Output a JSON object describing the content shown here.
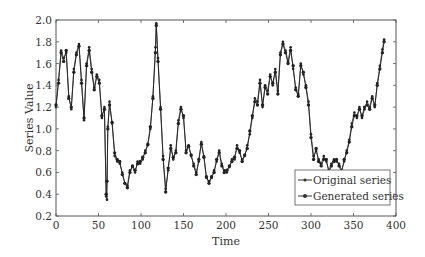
{
  "chart_data": {
    "type": "line",
    "title": "",
    "xlabel": "Time",
    "ylabel": "Series Value",
    "xlim": [
      0,
      400
    ],
    "ylim": [
      0.2,
      2.0
    ],
    "xticks": [
      0,
      50,
      100,
      150,
      200,
      250,
      300,
      350,
      400
    ],
    "yticks": [
      0.2,
      0.4,
      0.6,
      0.8,
      1.0,
      1.2,
      1.4,
      1.6,
      1.8,
      2.0
    ],
    "ytick_labels": [
      "0.2",
      "0.4",
      "0.6",
      "0.8",
      "1.0",
      "1.2",
      "1.4",
      "1.6",
      "1.8",
      "2.0"
    ],
    "grid": false,
    "legend_position": "lower right",
    "series": [
      {
        "name": "Original series",
        "marker": "dot",
        "x": [
          0,
          3,
          6,
          9,
          12,
          15,
          18,
          21,
          24,
          27,
          30,
          33,
          36,
          39,
          42,
          45,
          48,
          51,
          54,
          57,
          59,
          60,
          61,
          63,
          66,
          69,
          72,
          75,
          78,
          81,
          84,
          87,
          90,
          93,
          96,
          99,
          102,
          105,
          108,
          111,
          114,
          117,
          118,
          120,
          123,
          126,
          129,
          132,
          135,
          138,
          141,
          144,
          147,
          150,
          153,
          156,
          159,
          162,
          165,
          168,
          171,
          174,
          177,
          180,
          183,
          186,
          189,
          192,
          195,
          198,
          201,
          204,
          207,
          210,
          213,
          216,
          219,
          222,
          225,
          228,
          231,
          234,
          237,
          240,
          243,
          246,
          249,
          252,
          255,
          258,
          261,
          264,
          267,
          270,
          273,
          276,
          279,
          282,
          285,
          288,
          291,
          294,
          297,
          300,
          303,
          306,
          309,
          312,
          315,
          318,
          321,
          324,
          327,
          330,
          333,
          336,
          339,
          342,
          345,
          348,
          351,
          354,
          357,
          360,
          363,
          366,
          369,
          372,
          375,
          378,
          381,
          384,
          386
        ],
        "values": [
          1.2,
          1.45,
          1.72,
          1.65,
          1.7,
          1.3,
          1.18,
          1.55,
          1.7,
          1.78,
          1.45,
          1.08,
          1.6,
          1.75,
          1.55,
          1.38,
          1.5,
          1.45,
          1.1,
          1.2,
          0.38,
          0.35,
          1.02,
          1.25,
          1.05,
          0.75,
          0.7,
          0.68,
          0.6,
          0.5,
          0.48,
          0.62,
          0.65,
          0.6,
          0.7,
          0.68,
          0.72,
          0.8,
          0.85,
          1.0,
          1.3,
          1.75,
          1.97,
          1.65,
          1.2,
          0.75,
          0.45,
          0.62,
          0.85,
          0.72,
          0.8,
          1.08,
          1.2,
          1.1,
          0.8,
          0.85,
          0.75,
          0.68,
          0.6,
          0.7,
          0.88,
          0.75,
          0.55,
          0.52,
          0.55,
          0.62,
          0.7,
          0.8,
          0.68,
          0.62,
          0.6,
          0.65,
          0.72,
          0.72,
          0.85,
          0.78,
          0.72,
          0.75,
          0.85,
          0.95,
          1.1,
          1.28,
          1.25,
          1.45,
          1.2,
          1.4,
          1.35,
          1.5,
          1.4,
          1.55,
          1.35,
          1.7,
          1.8,
          1.72,
          1.62,
          1.75,
          1.55,
          1.38,
          1.32,
          1.6,
          1.5,
          1.4,
          1.25,
          0.95,
          0.75,
          0.8,
          0.72,
          0.68,
          0.75,
          0.7,
          0.62,
          0.68,
          0.72,
          0.7,
          0.68,
          0.62,
          0.7,
          0.8,
          0.9,
          1.05,
          1.15,
          1.1,
          1.2,
          1.1,
          1.18,
          1.25,
          1.2,
          1.3,
          1.2,
          1.42,
          1.58,
          1.73,
          1.82
        ]
      },
      {
        "name": "Generated series",
        "marker": "dot",
        "x": [
          0,
          3,
          6,
          9,
          12,
          15,
          18,
          21,
          24,
          27,
          30,
          33,
          36,
          39,
          42,
          45,
          48,
          51,
          54,
          57,
          59,
          60,
          61,
          63,
          66,
          69,
          72,
          75,
          78,
          81,
          84,
          87,
          90,
          93,
          96,
          99,
          102,
          105,
          108,
          111,
          114,
          117,
          118,
          120,
          123,
          126,
          129,
          132,
          135,
          138,
          141,
          144,
          147,
          150,
          153,
          156,
          159,
          162,
          165,
          168,
          171,
          174,
          177,
          180,
          183,
          186,
          189,
          192,
          195,
          198,
          201,
          204,
          207,
          210,
          213,
          216,
          219,
          222,
          225,
          228,
          231,
          234,
          237,
          240,
          243,
          246,
          249,
          252,
          255,
          258,
          261,
          264,
          267,
          270,
          273,
          276,
          279,
          282,
          285,
          288,
          291,
          294,
          297,
          300,
          303,
          306,
          309,
          312,
          315,
          318,
          321,
          324,
          327,
          330,
          333,
          336,
          339,
          342,
          345,
          348,
          351,
          354,
          357,
          360,
          363,
          366,
          369,
          372,
          375,
          378,
          381,
          384,
          386
        ],
        "values": [
          1.22,
          1.42,
          1.7,
          1.62,
          1.72,
          1.28,
          1.2,
          1.52,
          1.68,
          1.76,
          1.42,
          1.1,
          1.58,
          1.72,
          1.52,
          1.36,
          1.48,
          1.42,
          1.12,
          1.18,
          0.4,
          0.52,
          1.0,
          1.22,
          1.06,
          0.78,
          0.72,
          0.7,
          0.58,
          0.5,
          0.46,
          0.6,
          0.66,
          0.62,
          0.68,
          0.7,
          0.74,
          0.78,
          0.86,
          1.02,
          1.28,
          1.7,
          1.95,
          1.62,
          1.18,
          0.72,
          0.42,
          0.64,
          0.82,
          0.74,
          0.78,
          1.05,
          1.18,
          1.12,
          0.78,
          0.84,
          0.76,
          0.66,
          0.58,
          0.72,
          0.86,
          0.74,
          0.56,
          0.5,
          0.56,
          0.6,
          0.72,
          0.78,
          0.66,
          0.6,
          0.62,
          0.66,
          0.7,
          0.74,
          0.82,
          0.8,
          0.7,
          0.76,
          0.82,
          0.98,
          1.12,
          1.25,
          1.22,
          1.42,
          1.22,
          1.38,
          1.32,
          1.48,
          1.42,
          1.52,
          1.32,
          1.68,
          1.78,
          1.7,
          1.6,
          1.72,
          1.58,
          1.36,
          1.3,
          1.58,
          1.52,
          1.38,
          1.22,
          0.92,
          0.72,
          0.82,
          0.7,
          0.66,
          0.72,
          0.72,
          0.6,
          0.66,
          0.7,
          0.72,
          0.66,
          0.6,
          0.72,
          0.78,
          0.88,
          1.02,
          1.12,
          1.12,
          1.18,
          1.12,
          1.2,
          1.22,
          1.18,
          1.28,
          1.22,
          1.4,
          1.55,
          1.7,
          1.8
        ]
      }
    ]
  }
}
